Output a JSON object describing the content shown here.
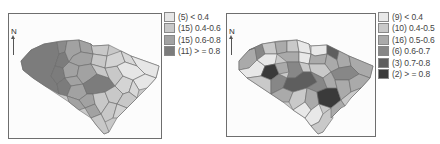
{
  "maps": [
    {
      "id": "left",
      "north_label": "N",
      "legend": [
        {
          "count": "(5)",
          "range": "< 0.4",
          "label": "(5) < 0.4",
          "color": "#e6e6e6"
        },
        {
          "count": "(15)",
          "range": "0.4-0.6",
          "label": "(15) 0.4-0.6",
          "color": "#c8c8c8"
        },
        {
          "count": "(15)",
          "range": "0.6-0.8",
          "label": "(15) 0.6-0.8",
          "color": "#a2a2a2"
        },
        {
          "count": "(11)",
          "range": "> = 0.8",
          "label": "(11) > = 0.8",
          "color": "#7c7c7c"
        }
      ]
    },
    {
      "id": "right",
      "north_label": "N",
      "legend": [
        {
          "count": "(9)",
          "range": "< 0.4",
          "label": "(9) < 0.4",
          "color": "#e8e8e8"
        },
        {
          "count": "(10)",
          "range": "0.4-0.5",
          "label": "(10) 0.4-0.5",
          "color": "#c9c9c9"
        },
        {
          "count": "(16)",
          "range": "0.5-0.6",
          "label": "(16) 0.5-0.6",
          "color": "#aaaaaa"
        },
        {
          "count": "(6)",
          "range": "0.6-0.7",
          "label": "(6) 0.6-0.7",
          "color": "#878787"
        },
        {
          "count": "(3)",
          "range": "0.7-0.8",
          "label": "(3) 0.7-0.8",
          "color": "#5e5e5e"
        },
        {
          "count": "(2)",
          "range": "> = 0.8",
          "label": "(2) > = 0.8",
          "color": "#3a3a3a"
        }
      ]
    }
  ]
}
